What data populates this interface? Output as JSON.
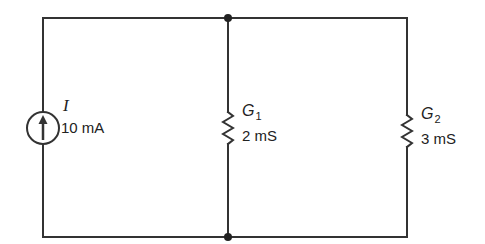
{
  "diagram": {
    "type": "parallel-circuit",
    "wire_color": "#333333",
    "components": [
      {
        "id": "source",
        "kind": "current-source",
        "symbol": "I",
        "value": "10 mA",
        "direction": "up"
      },
      {
        "id": "g1",
        "kind": "conductance",
        "symbol": "G",
        "subscript": "1",
        "value": "2 mS"
      },
      {
        "id": "g2",
        "kind": "conductance",
        "symbol": "G",
        "subscript": "2",
        "value": "3 mS"
      }
    ],
    "nodes": [
      {
        "id": "top-node",
        "position": "top-middle"
      },
      {
        "id": "bottom-node",
        "position": "bottom-middle"
      }
    ]
  }
}
